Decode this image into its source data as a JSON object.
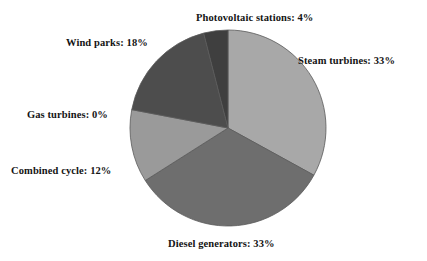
{
  "chart_data": {
    "type": "pie",
    "title": "",
    "subtitle": "",
    "xlabel": "",
    "ylabel": "",
    "legend_position": "none",
    "grid": false,
    "units": "percent",
    "start_angle_deg": 0,
    "direction": "clockwise",
    "center": {
      "x": 228,
      "y": 128
    },
    "radius": 98,
    "categories": [
      "Steam turbines",
      "Diesel generators",
      "Combined cycle",
      "Gas turbines",
      "Wind parks",
      "Photovoltaic stations"
    ],
    "values": [
      33,
      33,
      12,
      0,
      18,
      4
    ],
    "slices": [
      {
        "name": "Steam turbines",
        "label": "Steam turbines: 33%",
        "value": 33,
        "value_text": "33%",
        "color": "#a8a8a8",
        "start_deg": 0,
        "end_deg": 118.8
      },
      {
        "name": "Diesel generators",
        "label": "Diesel generators: 33%",
        "value": 33,
        "value_text": "33%",
        "color": "#6e6e6e",
        "start_deg": 118.8,
        "end_deg": 237.6
      },
      {
        "name": "Combined cycle",
        "label": "Combined cycle: 12%",
        "value": 12,
        "value_text": "12%",
        "color": "#9a9a9a",
        "start_deg": 237.6,
        "end_deg": 280.8
      },
      {
        "name": "Gas turbines",
        "label": "Gas turbines: 0%",
        "value": 0,
        "value_text": "0%",
        "color": "#848484",
        "start_deg": 280.8,
        "end_deg": 280.8
      },
      {
        "name": "Wind parks",
        "label": "Wind parks: 18%",
        "value": 18,
        "value_text": "18%",
        "color": "#4d4d4d",
        "start_deg": 280.8,
        "end_deg": 345.6
      },
      {
        "name": "Photovoltaic stations",
        "label": "Photovoltaic stations: 4%",
        "value": 4,
        "value_text": "4%",
        "color": "#3f3f3f",
        "start_deg": 345.6,
        "end_deg": 360
      }
    ]
  },
  "labels": {
    "photovoltaic": "Photovoltaic stations: 4%",
    "steam": "Steam turbines: 33%",
    "wind": "Wind parks: 18%",
    "gas": "Gas turbines: 0%",
    "combined": "Combined cycle: 12%",
    "diesel": "Diesel generators: 33%"
  },
  "colors": {
    "background": "#ffffff",
    "text": "#141414",
    "slice_outline": "#5a5a5a"
  }
}
